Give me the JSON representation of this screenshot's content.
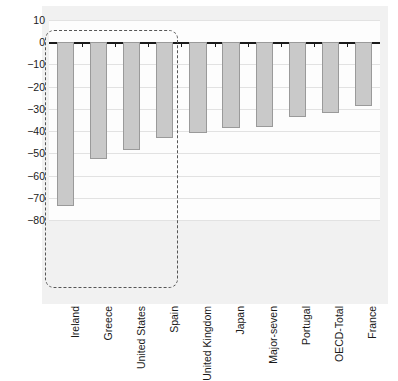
{
  "chart_data": {
    "type": "bar",
    "title": "",
    "subtitle": "",
    "xlabel": "",
    "ylabel": "",
    "categories": [
      "Ireland",
      "Greece",
      "United States",
      "Spain",
      "United Kingdom",
      "Japan",
      "Major-seven",
      "Portugal",
      "OECD-Total",
      "France"
    ],
    "values": [
      -73.5,
      -52.5,
      -48.5,
      -43.0,
      -41.0,
      -38.5,
      -38.0,
      -33.5,
      -32.0,
      -28.5
    ],
    "ylim": [
      -80,
      10
    ],
    "yticks": [
      10,
      0,
      -10,
      -20,
      -30,
      -40,
      -50,
      -60,
      -70,
      -80
    ],
    "ytick_labels": [
      "10",
      "0",
      "−10",
      "−20",
      "−30",
      "−40",
      "−50",
      "−60",
      "−70",
      "−80"
    ],
    "grid": true,
    "legend": "none",
    "annotations": [
      {
        "name": "highlighted-group",
        "type": "dashed-box",
        "covers": [
          "Ireland",
          "Greece",
          "United States",
          "Spain"
        ]
      }
    ],
    "colors": {
      "bar_fill": "#c9c9c9",
      "bar_edge": "#9a9a9a",
      "panel_background": "#f1f1f1",
      "plot_background": "#fdfdfd",
      "gridline": "#e2e2e2",
      "zero_line": "#1a1a1a",
      "highlight_box": "#555555",
      "text": "#1a1a1a"
    }
  }
}
